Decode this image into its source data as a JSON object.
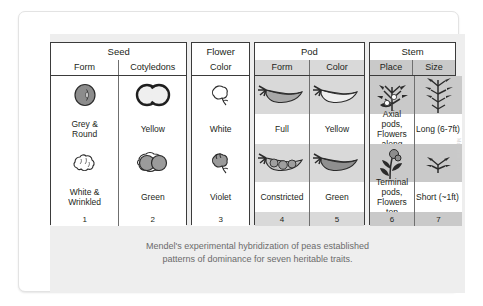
{
  "figure": {
    "caption_line1": "Mendel's experimental hybridization of peas established",
    "caption_line2": "patterns of dominance for seven heritable traits.",
    "credit": "Mariana Ruiz"
  },
  "groups": [
    {
      "title": "Seed",
      "columns": [
        {
          "subhead": "Form",
          "number": "1",
          "dominant": {
            "label": "Grey &\nRound",
            "icon": "round-seed-icon"
          },
          "recessive": {
            "label": "White &\nWrinkled",
            "icon": "wrinkled-seed-icon"
          }
        },
        {
          "subhead": "Cotyledons",
          "number": "2",
          "dominant": {
            "label": "Yellow",
            "icon": "yellow-cotyledons-icon"
          },
          "recessive": {
            "label": "Green",
            "icon": "green-cotyledons-icon"
          }
        }
      ]
    },
    {
      "title": "Flower",
      "columns": [
        {
          "subhead": "Color",
          "number": "3",
          "dominant": {
            "label": "White",
            "icon": "white-flower-icon"
          },
          "recessive": {
            "label": "Violet",
            "icon": "violet-flower-icon"
          }
        }
      ]
    },
    {
      "title": "Pod",
      "columns": [
        {
          "subhead": "Form",
          "number": "4",
          "dominant": {
            "label": "Full",
            "icon": "full-pod-icon"
          },
          "recessive": {
            "label": "Constricted",
            "icon": "constricted-pod-icon"
          }
        },
        {
          "subhead": "Color",
          "number": "5",
          "dominant": {
            "label": "Yellow",
            "icon": "yellow-pod-icon"
          },
          "recessive": {
            "label": "Green",
            "icon": "green-pod-icon"
          }
        }
      ]
    },
    {
      "title": "Stem",
      "columns": [
        {
          "subhead": "Place",
          "number": "6",
          "dominant": {
            "label": "Axial pods,\nFlowers along",
            "icon": "axial-plant-icon"
          },
          "recessive": {
            "label": "Terminal pods,\nFlowers top",
            "icon": "terminal-plant-icon"
          }
        },
        {
          "subhead": "Size",
          "number": "7",
          "dominant": {
            "label": "Long (6-7ft)",
            "icon": "tall-plant-icon"
          },
          "recessive": {
            "label": "Short (~1ft)",
            "icon": "short-plant-icon"
          }
        }
      ]
    }
  ]
}
